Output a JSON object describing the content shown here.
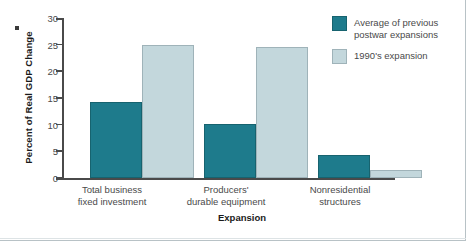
{
  "chart_data": {
    "type": "bar",
    "title": "",
    "xlabel": "Expansion",
    "ylabel": "Percent of Real GDP Change",
    "categories": [
      "Total business\nfixed investment",
      "Producers'\ndurable equipment",
      "Nonresidential\nstructures"
    ],
    "categories_lines": [
      [
        "Total business",
        "fixed investment"
      ],
      [
        "Producers'",
        "durable equipment"
      ],
      [
        "Nonresidential",
        "structures"
      ]
    ],
    "series": [
      {
        "name": "Average of previous postwar expansions",
        "name_lines": [
          "Average of previous",
          "postwar expansions"
        ],
        "color": "#1e7b8c",
        "values": [
          14.3,
          10.1,
          4.3
        ]
      },
      {
        "name": "1990's expansion",
        "name_lines": [
          "1990's expansion"
        ],
        "color": "#c3d7dc",
        "values": [
          25.0,
          24.5,
          1.5
        ]
      }
    ],
    "ylim": [
      0,
      30
    ],
    "yticks": [
      0,
      5,
      10,
      15,
      20,
      25,
      30
    ],
    "ytick_labels": [
      "0",
      "5",
      "10",
      "15",
      "20",
      "25",
      "30"
    ],
    "grid": false,
    "legend_position": "top-right"
  },
  "colors": {
    "series_dark": "#1e7b8c",
    "series_light": "#c3d7dc",
    "axis": "#4a4a4a",
    "text": "#4a4a4a",
    "frame": "#b8c2c6"
  }
}
